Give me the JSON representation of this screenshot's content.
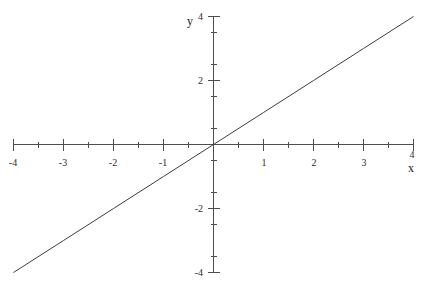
{
  "chart_data": {
    "type": "line",
    "title": "",
    "xlabel": "x",
    "ylabel": "y",
    "xlim": [
      -4,
      4
    ],
    "ylim": [
      -4,
      4
    ],
    "grid": false,
    "legend": false,
    "x_major_ticks": [
      -4,
      -3,
      -2,
      -1,
      0,
      1,
      2,
      3,
      4
    ],
    "y_major_ticks": [
      -4,
      -2,
      0,
      2,
      4
    ],
    "x_tick_labels": [
      "-4",
      "-3",
      "-2",
      "-1",
      "",
      "1",
      "2",
      "3",
      "4"
    ],
    "y_tick_labels": [
      "-4",
      "-2",
      "",
      "2",
      "4"
    ],
    "x_minor_step": 0.5,
    "y_minor_step": 0.5,
    "series": [
      {
        "name": "y = x",
        "x": [
          -4,
          -3,
          -2,
          -1,
          0,
          1,
          2,
          3,
          4
        ],
        "values": [
          -4,
          -3,
          -2,
          -1,
          0,
          1,
          2,
          3,
          4
        ],
        "color": "#3d3d3d"
      }
    ],
    "annotations": []
  },
  "labels": {
    "x_axis_name": "x",
    "y_axis_name": "y",
    "x_neg4": "-4",
    "x_neg3": "-3",
    "x_neg2": "-2",
    "x_neg1": "-1",
    "x_pos1": "1",
    "x_pos2": "2",
    "x_pos3": "3",
    "x_pos4": "4",
    "y_neg4": "-4",
    "y_neg2": "-2",
    "y_pos2": "2",
    "y_pos4": "4"
  },
  "colors": {
    "axis": "#4d4d4d",
    "line": "#3d3d3d",
    "text": "#1a1a1a",
    "background": "#ffffff"
  }
}
